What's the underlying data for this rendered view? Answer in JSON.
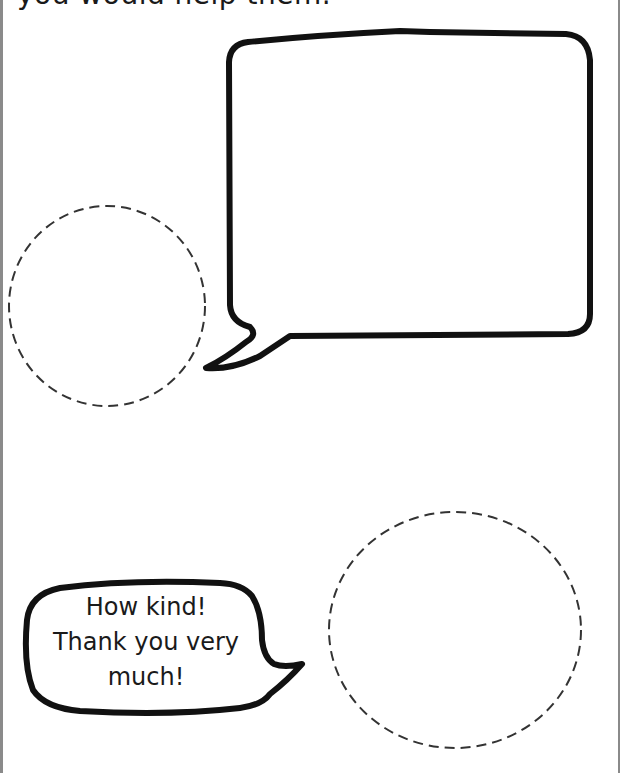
{
  "worksheet": {
    "instruction_tail": "you would help them.",
    "speech_bubble_top": {
      "content": "",
      "shape": "rectangular speech bubble, tail pointing bottom-left"
    },
    "circle_top_left": {
      "content": "",
      "style": "dashed"
    },
    "speech_bubble_bottom": {
      "lines": [
        "How kind!",
        "Thank you very",
        "much!"
      ],
      "shape": "rounded speech bubble, tail pointing right"
    },
    "circle_bottom_right": {
      "content": "",
      "style": "dashed"
    },
    "colors": {
      "ink": "#111111",
      "dashed_line": "#333333",
      "page_border": "#8a8a8a",
      "background": "#ffffff"
    }
  }
}
